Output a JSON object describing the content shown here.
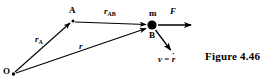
{
  "figure": {
    "caption": "Figure 4.46",
    "background_color": "#ffffff",
    "ink_color": "#000000",
    "width": 274,
    "height": 84
  },
  "points": [
    {
      "id": "O",
      "label": "O",
      "x": 13,
      "y": 74,
      "role": "origin"
    },
    {
      "id": "A",
      "label": "A",
      "x": 73,
      "y": 22,
      "role": "reference-point"
    },
    {
      "id": "B",
      "label": "B",
      "x": 152,
      "y": 25,
      "role": "particle-position"
    }
  ],
  "mass_marker": {
    "label": "m",
    "x": 152,
    "y": 25,
    "radius": 4.5,
    "color": "#000000"
  },
  "vectors": [
    {
      "id": "rA",
      "label": "r",
      "subscript": "A",
      "from": "O",
      "to": "A",
      "x1": 15,
      "y1": 72,
      "x2": 70,
      "y2": 23,
      "label_x": 35,
      "label_y": 35
    },
    {
      "id": "rAB",
      "label": "r",
      "subscript": "AB",
      "from": "A",
      "to": "B",
      "x1": 75,
      "y1": 22,
      "x2": 147,
      "y2": 25,
      "label_x": 104,
      "label_y": 7
    },
    {
      "id": "r",
      "label": "r",
      "subscript": "",
      "from": "O",
      "to": "B",
      "x1": 16,
      "y1": 73,
      "x2": 147,
      "y2": 28,
      "label_x": 79,
      "label_y": 42
    },
    {
      "id": "F",
      "label": "F",
      "subscript": "",
      "from": "B",
      "to": "force-tip",
      "x1": 158,
      "y1": 25,
      "x2": 192,
      "y2": 25,
      "label_x": 170,
      "label_y": 7
    },
    {
      "id": "v",
      "label": "v = ṙ",
      "subscript": "",
      "from": "B",
      "to": "velocity-tip",
      "x1": 155,
      "y1": 30,
      "x2": 172,
      "y2": 52,
      "label_x": 158,
      "label_y": 55
    }
  ],
  "labels": {
    "r_AB_base": "r",
    "r_AB_sub": "AB",
    "r_A_base": "r",
    "r_A_sub": "A",
    "r_base": "r",
    "force": "F",
    "velocity_lhs": "v",
    "velocity_eq": " = ",
    "velocity_rhs": "r",
    "velocity_dot": "·",
    "point_A": "A",
    "point_B": "B",
    "point_O": "O",
    "mass": "m"
  }
}
